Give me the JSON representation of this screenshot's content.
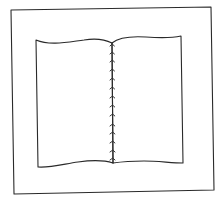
{
  "illustration": {
    "subject": "open book with stitched spine",
    "ink_color": "#2a2a2a",
    "background": "#ffffff",
    "frame": {
      "shape": "square outline"
    },
    "book": {
      "pages": [
        "left-page",
        "right-page"
      ],
      "spine": {
        "binding": "stitched",
        "stitch_count": 14
      }
    }
  }
}
